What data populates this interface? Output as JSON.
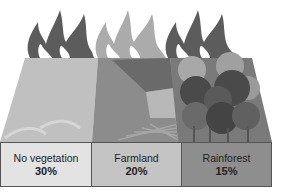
{
  "diagram": {
    "type": "illustration",
    "segments": [
      {
        "name": "No vegetation",
        "value": "30%",
        "box_color": "#e3e3e3",
        "flame_color": "#5a5a5a",
        "land_color": "#bdbdbd"
      },
      {
        "name": "Farmland",
        "value": "20%",
        "box_color": "#c4c4c4",
        "flame_color": "#acacac",
        "land_color": "#8a8a8a"
      },
      {
        "name": "Rainforest",
        "value": "15%",
        "box_color": "#8e8e8e",
        "flame_color": "#5a5a5a",
        "land_color": "#6e6e6e"
      }
    ]
  }
}
